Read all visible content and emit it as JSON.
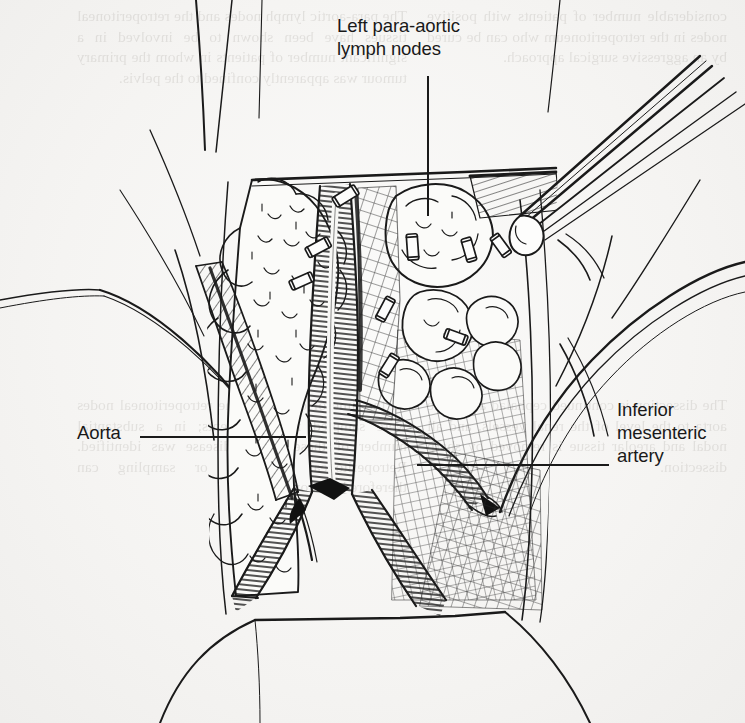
{
  "page": {
    "type": "scanned-book-illustration",
    "width": 745,
    "height": 723,
    "background_color": "#f6f5f3",
    "ink_color": "#1a1a1a",
    "bleed_text_color": "#4a4238"
  },
  "figure": {
    "labels": [
      {
        "name": "left-para-aortic-lymph-nodes",
        "lines": [
          "Left para-aortic",
          "lymph nodes"
        ],
        "text": "Left para-aortic\nlymph nodes",
        "leader": "vertical"
      },
      {
        "name": "aorta",
        "lines": [
          "Aorta"
        ],
        "text": "Aorta",
        "leader": "horizontal"
      },
      {
        "name": "inferior-mesenteric-artery",
        "lines": [
          "Inferior",
          "mesenteric",
          "artery"
        ],
        "text": "Inferior\nmesenteric\nartery",
        "leader": "horizontal"
      }
    ]
  },
  "bleed_through": {
    "note": "Faint mirror-reversed show-through text from the reverse side of the printed page; largely illegible in the scan.",
    "top_left": "considerable number of patients with positive nodes in the retroperitoneum who can be cured by an aggressive surgical approach.",
    "top_right": "The para-aortic lymph nodes and the retroperitoneal tissues have been shown to be involved in a significant number of patients in whom the primary tumour was apparently confined to the pelvis.",
    "mid_left": "The dissection is continued cephalad along the aorta to the level of the renal vessels, and all nodal and areolar tissue is removed by sharp dissection.",
    "mid_right": "At the time of operation, the retroperitoneal nodes were sampled in all patients; in a substantial number of these, occult disease was identified. Retroperitoneal dissection or sampling can therefore be recommended."
  }
}
